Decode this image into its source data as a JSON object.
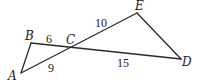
{
  "diagram": {
    "type": "geometry",
    "points": {
      "A": {
        "label": "A",
        "x": 21,
        "y": 73,
        "lx": 8,
        "ly": 80
      },
      "B": {
        "label": "B",
        "x": 31,
        "y": 43,
        "lx": 25,
        "ly": 40
      },
      "C": {
        "label": "C",
        "x": 72,
        "y": 47,
        "lx": 66,
        "ly": 44
      },
      "D": {
        "label": "D",
        "x": 181,
        "y": 59,
        "lx": 182,
        "ly": 66
      },
      "E": {
        "label": "E",
        "x": 137,
        "y": 13,
        "lx": 135,
        "ly": 10
      }
    },
    "segments": [
      {
        "from": "A",
        "to": "B"
      },
      {
        "from": "B",
        "to": "D"
      },
      {
        "from": "A",
        "to": "E"
      },
      {
        "from": "E",
        "to": "D"
      }
    ],
    "measures": [
      {
        "segment": "BC",
        "value": "6",
        "x": 46,
        "y": 43
      },
      {
        "segment": "CE",
        "value": "10",
        "x": 95,
        "y": 27
      },
      {
        "segment": "AC",
        "value": "9",
        "x": 48,
        "y": 72
      },
      {
        "segment": "CD",
        "value": "15",
        "x": 117,
        "y": 67
      }
    ]
  }
}
